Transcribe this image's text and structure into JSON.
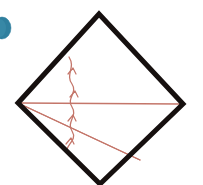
{
  "figure": {
    "canvas": {
      "width": 203,
      "height": 185,
      "background": "#ffffff"
    },
    "colors": {
      "outline": "#16100f",
      "ray": "#c4766a",
      "ray_light": "#d79a8e",
      "marker_blue": "#2f7f9e",
      "background": "#ffffff"
    },
    "diamond": {
      "name": "square rotated 45 degrees",
      "stroke_width": 5,
      "vertices": [
        {
          "label": "top",
          "x": 99,
          "y": 14
        },
        {
          "label": "right",
          "x": 183,
          "y": 104
        },
        {
          "label": "bottom",
          "x": 100,
          "y": 184
        },
        {
          "label": "left",
          "x": 18,
          "y": 103
        }
      ]
    },
    "source_point": {
      "label": "left vertex source",
      "x": 18,
      "y": 103
    },
    "rays": [
      {
        "label": "upper ray",
        "from": {
          "x": 18,
          "y": 103
        },
        "to": {
          "x": 151,
          "y": 45
        },
        "stroke_width": 1.2
      },
      {
        "label": "horizontal axis ray",
        "from": {
          "x": 18,
          "y": 103
        },
        "to": {
          "x": 181,
          "y": 104
        },
        "stroke_width": 1.6
      },
      {
        "label": "lower ray",
        "from": {
          "x": 18,
          "y": 103
        },
        "to": {
          "x": 140,
          "y": 160
        },
        "stroke_width": 1.2
      }
    ],
    "wavefront": {
      "label": "curved wavefront with arrowheads",
      "stroke_width": 1.3,
      "path": "M 69 57 C 76 68, 65 74, 72 84 C 78 93, 66 98, 72 107 C 78 116, 66 122, 72 131 C 77 139, 69 143, 67 149",
      "arrow_marks": [
        {
          "label": "arrow-upper",
          "x": 72,
          "y": 70
        },
        {
          "label": "arrow-mid-upper",
          "x": 74,
          "y": 93
        },
        {
          "label": "arrow-mid-lower",
          "x": 72,
          "y": 117
        },
        {
          "label": "arrow-lower",
          "x": 70,
          "y": 140
        }
      ]
    },
    "blue_marker": {
      "label": "blue ellipse cropped at left edge",
      "cx": 2,
      "cy": 28,
      "rx": 9,
      "ry": 11
    }
  }
}
